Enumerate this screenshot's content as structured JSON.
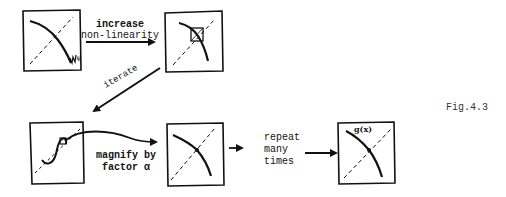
{
  "figure_label": "Fig.4.3",
  "steps": {
    "increase": {
      "line1": "increase",
      "line2": "non-linearity"
    },
    "iterate": {
      "label": "iterate"
    },
    "magnify": {
      "line1": "magnify by",
      "line2": "factor α"
    },
    "repeat": {
      "line1": "repeat",
      "line2": "many",
      "line3": "times"
    }
  },
  "panels": [
    {
      "id": "panel-1",
      "description": "function curve crossing diagonal, wiggly tail",
      "curve_label": "ψ"
    },
    {
      "id": "panel-2",
      "description": "steeper curve with boxed fixed-point region"
    },
    {
      "id": "panel-3",
      "description": "iterated map, small boxed region near diagonal"
    },
    {
      "id": "panel-4",
      "description": "magnified curve through fixed point"
    },
    {
      "id": "panel-5",
      "description": "limiting function g(x)",
      "curve_label": "g(x)"
    }
  ]
}
